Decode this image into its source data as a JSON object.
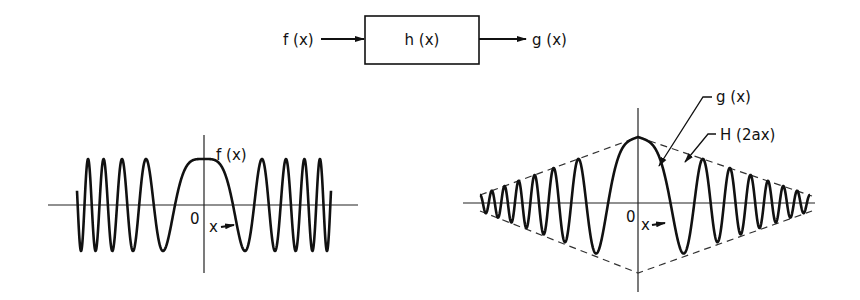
{
  "block_diagram": {
    "input_label": "f (x)",
    "system_label": "h (x)",
    "output_label": "g (x)"
  },
  "left_plot": {
    "curve_label": "f (x)",
    "origin_label": "0",
    "x_arrow_label": "x",
    "description": "Chirp signal f(x): constant amplitude, frequency increasing with |x|, symmetric (even) about x=0, maximum at origin"
  },
  "right_plot": {
    "curve_label": "g (x)",
    "envelope_label": "H (2ax)",
    "origin_label": "0",
    "x_arrow_label": "x",
    "description": "Output g(x): chirp with amplitude envelope H(2ax) (dashed, triangular), decaying away from origin"
  },
  "colors": {
    "ink": "#111111",
    "background": "#ffffff"
  }
}
